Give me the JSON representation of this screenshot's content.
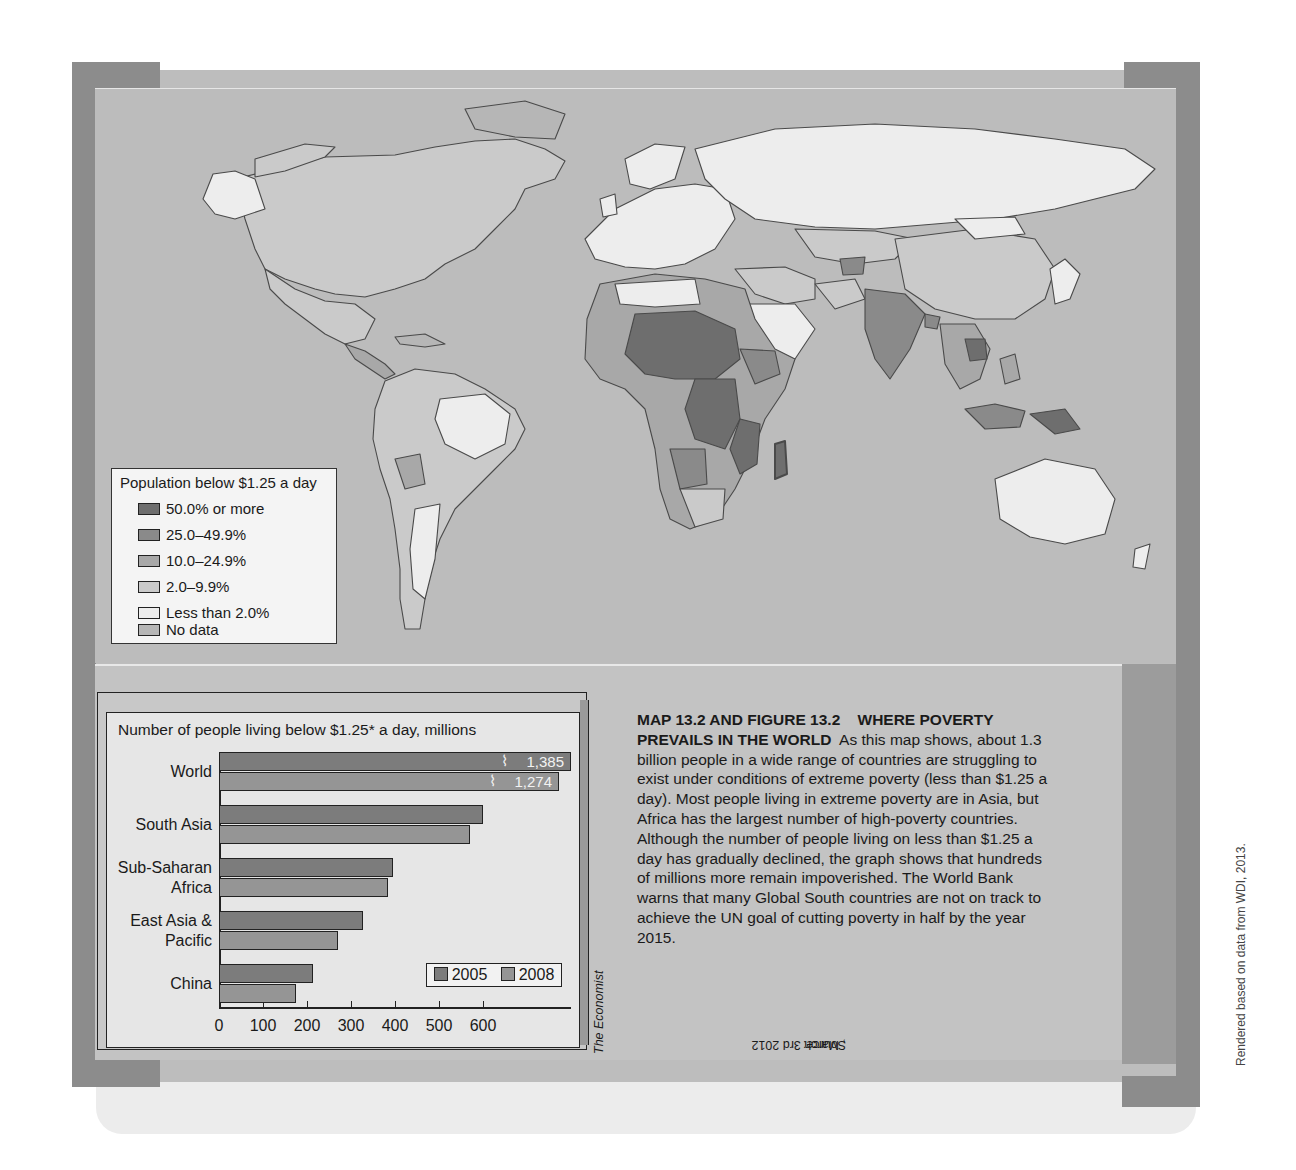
{
  "map": {
    "title": "Population below $1.25 a day",
    "legend": [
      {
        "label": "50.0% or more",
        "color": "#6e6e6e"
      },
      {
        "label": "25.0–49.9%",
        "color": "#8a8a8a"
      },
      {
        "label": "10.0–24.9%",
        "color": "#a8a8a8"
      },
      {
        "label": "2.0–9.9%",
        "color": "#cacaca"
      },
      {
        "label": "Less than 2.0%",
        "color": "#ededed"
      },
      {
        "label": "No data",
        "color": "#b6b6b6"
      }
    ],
    "colors": {
      "sea": "#bcbcbc",
      "border": "#4a4a4a"
    }
  },
  "chart_data": {
    "type": "bar",
    "orientation": "horizontal",
    "title": "Number of people living below $1.25* a day, millions",
    "categories": [
      "World",
      "South Asia",
      "Sub-Saharan Africa",
      "East Asia & Pacific",
      "China"
    ],
    "category_labels": [
      [
        "World"
      ],
      [
        "South Asia"
      ],
      [
        "Sub-Saharan",
        "Africa"
      ],
      [
        "East Asia &",
        "Pacific"
      ],
      [
        "China"
      ]
    ],
    "series": [
      {
        "name": "2005",
        "color": "#7c7c7c",
        "values": [
          1385,
          600,
          395,
          328,
          213
        ]
      },
      {
        "name": "2008",
        "color": "#959595",
        "values": [
          1274,
          571,
          383,
          271,
          174
        ]
      }
    ],
    "value_labels": {
      "World": [
        "1,385",
        "1,274"
      ]
    },
    "xticks": [
      "0",
      "100",
      "200",
      "300",
      "400",
      "500",
      "600"
    ],
    "xlim": [
      0,
      600
    ],
    "axis_break": true,
    "xlabel": "",
    "ylabel": "",
    "legend_position": "lower right",
    "grid": false
  },
  "source": {
    "prefix": "Source: ",
    "publication": "The Economist",
    "suffix": ", March 3rd 2012"
  },
  "caption": {
    "heading": "MAP 13.2 AND FIGURE 13.2    WHERE POVERTY PREVAILS IN THE WORLD",
    "body": "As this map shows, about 1.3 billion people in a wide range of countries are struggling to exist under conditions of extreme poverty (less than $1.25 a day). Most people living in extreme poverty are in Asia, but Africa has the largest number of high-poverty countries. Although the number of people living on less than $1.25 a day has gradually declined, the graph shows that hundreds of millions more remain impoverished. The World Bank warns that many Global South countries are not on track to achieve the UN goal of cutting poverty in half by the year 2015."
  },
  "credit": "Rendered  based on data from WDI, 2013."
}
